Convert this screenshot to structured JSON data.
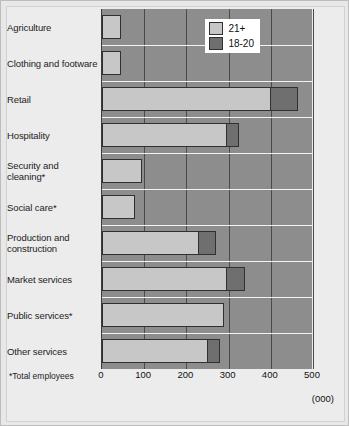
{
  "chart_data": {
    "type": "bar",
    "orientation": "horizontal",
    "stacked": true,
    "title": "",
    "xlabel": "",
    "ylabel": "",
    "units_note": "(000)",
    "footnote": "*Total employees",
    "xlim": [
      0,
      500
    ],
    "xticks": [
      0,
      100,
      200,
      300,
      400,
      500
    ],
    "xtick_labels": [
      "0",
      "100",
      "200",
      "300",
      "400",
      "500"
    ],
    "grid": "vertical",
    "legend_position": "top-right-inside",
    "categories": [
      "Agriculture",
      "Clothing and footware",
      "Retail",
      "Hospitality",
      "Security and cleaning*",
      "Social care*",
      "Production and construction",
      "Market services",
      "Public services*",
      "Other services"
    ],
    "series": [
      {
        "name": "21+",
        "color": "#c7c7c7",
        "values": [
          45,
          45,
          400,
          295,
          95,
          78,
          230,
          295,
          288,
          250
        ]
      },
      {
        "name": "18-20",
        "color": "#6f6f6f",
        "values": [
          0,
          0,
          65,
          30,
          0,
          0,
          40,
          45,
          0,
          30
        ]
      }
    ],
    "totals": [
      45,
      45,
      465,
      325,
      95,
      78,
      270,
      340,
      288,
      280
    ]
  },
  "legend": {
    "items": [
      {
        "label": "21+",
        "swatch": "light"
      },
      {
        "label": "18-20",
        "swatch": "dark"
      }
    ]
  },
  "axis": {
    "ticks": [
      "0",
      "100",
      "200",
      "300",
      "400",
      "500"
    ]
  },
  "notes": {
    "footnote": "*Total employees",
    "units": "(000)"
  },
  "colors": {
    "plot_background": "#8d8d8d",
    "gridline": "#4a4a4a",
    "row_separator": "#f2f2f2",
    "bar_light": "#c7c7c7",
    "bar_dark": "#6f6f6f",
    "bar_outline": "#303030",
    "page_background": "#ececed"
  }
}
